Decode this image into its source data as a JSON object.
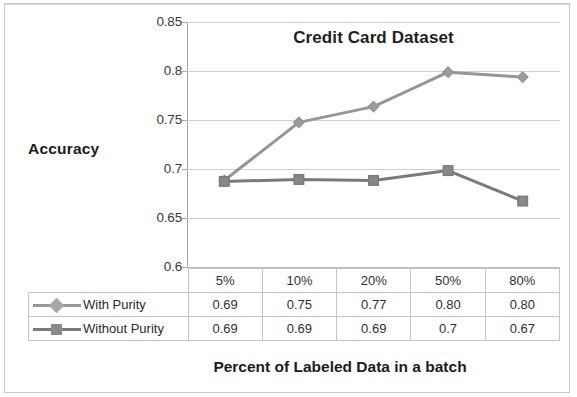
{
  "chart_data": {
    "type": "line",
    "title": "Credit Card Dataset",
    "xlabel": "Percent of Labeled Data in a batch",
    "ylabel": "Accuracy",
    "categories": [
      "5%",
      "10%",
      "20%",
      "50%",
      "80%"
    ],
    "ylim": [
      0.6,
      0.85
    ],
    "yticks": [
      "0.6",
      "0.65",
      "0.7",
      "0.75",
      "0.8",
      "0.85"
    ],
    "ytick_values": [
      0.6,
      0.65,
      0.7,
      0.75,
      0.8,
      0.85
    ],
    "grid": true,
    "legend_position": "table-left",
    "series": [
      {
        "name": "With Purity",
        "marker": "diamond",
        "color": "#969696",
        "values": [
          0.69,
          0.75,
          0.77,
          0.8,
          0.8
        ],
        "plotted_values": [
          0.689,
          0.748,
          0.764,
          0.799,
          0.794
        ],
        "labels": [
          "0.69",
          "0.75",
          "0.77",
          "0.80",
          "0.80"
        ]
      },
      {
        "name": "Without Purity",
        "marker": "square",
        "color": "#7b7b7b",
        "values": [
          0.69,
          0.69,
          0.69,
          0.7,
          0.67
        ],
        "plotted_values": [
          0.688,
          0.69,
          0.689,
          0.699,
          0.668
        ],
        "labels": [
          "0.69",
          "0.69",
          "0.69",
          "0.7",
          "0.67"
        ]
      }
    ]
  },
  "table": {
    "corner_label": "",
    "column_headers": [
      "5%",
      "10%",
      "20%",
      "50%",
      "80%"
    ],
    "rows": [
      {
        "legend_label": "With Purity",
        "marker": "diamond-marker",
        "cells": [
          "0.69",
          "0.75",
          "0.77",
          "0.80",
          "0.80"
        ]
      },
      {
        "legend_label": "Without Purity",
        "marker": "square-marker",
        "cells": [
          "0.69",
          "0.69",
          "0.69",
          "0.7",
          "0.67"
        ]
      }
    ]
  },
  "colors": {
    "series_with_purity": "#969696",
    "series_without_purity": "#7b7b7b",
    "gridline": "#d0d0d0",
    "axis": "#a6a6a6",
    "text": "#303030",
    "background": "#ffffff"
  }
}
